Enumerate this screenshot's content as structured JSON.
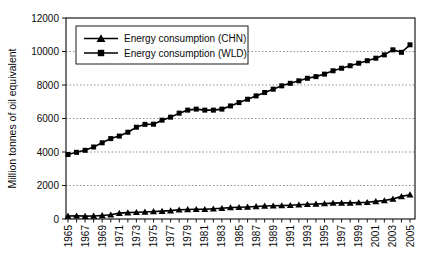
{
  "figure": {
    "background": "#ffffff",
    "axis_color": "#1a1a1a",
    "grid_color": "#8f8f8f",
    "series_color": "#000000"
  },
  "chart_data": {
    "type": "line",
    "title": "",
    "xlabel": "",
    "ylabel": "Million tonnes of oil equivalent",
    "ylim": [
      0,
      12000
    ],
    "ytick_step": 2000,
    "xtick_label_step": 2,
    "grid": "horizontal-dotted",
    "legend_position": "upper-left-inside",
    "x": [
      1965,
      1966,
      1967,
      1968,
      1969,
      1970,
      1971,
      1972,
      1973,
      1974,
      1975,
      1976,
      1977,
      1978,
      1979,
      1980,
      1981,
      1982,
      1983,
      1984,
      1985,
      1986,
      1987,
      1988,
      1989,
      1990,
      1991,
      1992,
      1993,
      1994,
      1995,
      1996,
      1997,
      1998,
      1999,
      2000,
      2001,
      2002,
      2003,
      2004,
      2005
    ],
    "series": [
      {
        "name": "Energy consumption (CHN)",
        "marker": "triangle",
        "color": "#000000",
        "values": [
          180,
          190,
          170,
          180,
          210,
          250,
          350,
          380,
          400,
          420,
          450,
          470,
          500,
          550,
          570,
          580,
          580,
          610,
          640,
          680,
          700,
          720,
          750,
          780,
          790,
          800,
          820,
          850,
          880,
          900,
          920,
          950,
          960,
          960,
          980,
          1000,
          1050,
          1100,
          1200,
          1350,
          1450
        ]
      },
      {
        "name": "Energy consumption (WLD)",
        "marker": "square",
        "color": "#000000",
        "values": [
          3850,
          3980,
          4100,
          4300,
          4550,
          4800,
          4950,
          5180,
          5480,
          5650,
          5660,
          5900,
          6080,
          6320,
          6500,
          6560,
          6500,
          6500,
          6560,
          6750,
          6950,
          7150,
          7350,
          7550,
          7750,
          7950,
          8100,
          8250,
          8400,
          8500,
          8650,
          8850,
          9000,
          9150,
          9300,
          9450,
          9600,
          9800,
          10100,
          9950,
          10400
        ]
      }
    ]
  }
}
